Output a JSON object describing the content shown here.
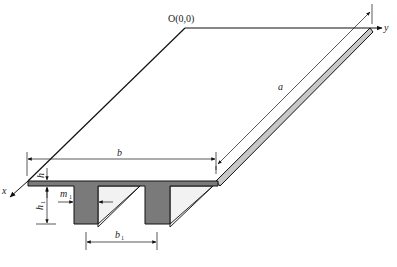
{
  "diagram": {
    "type": "ribbed-plate-isometric",
    "origin_label": "O(0,0)",
    "axes": {
      "x": "x",
      "y": "y"
    },
    "dimensions": {
      "length": "a",
      "width": "b",
      "plate_thickness": "h",
      "rib_depth": {
        "main": "h",
        "sub": "1"
      },
      "rib_width": {
        "main": "m",
        "sub": "1"
      },
      "rib_spacing": {
        "main": "b",
        "sub": "1"
      }
    },
    "colors": {
      "section_fill": "#7a7a7a",
      "side_face_fill": "#f2f2f2",
      "edge_face_fill": "#c8c8c8",
      "line": "#111111"
    }
  }
}
